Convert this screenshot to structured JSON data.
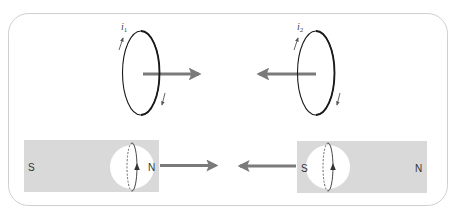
{
  "figure": {
    "colors": {
      "frame_border": "#cfcfcf",
      "magnet_fill": "#d9d9d9",
      "arrow": "#7a7a7a",
      "loop_stroke": "#1a1a1a",
      "circle_fill": "#ffffff"
    },
    "top_row": {
      "loop_left": {
        "current_label": "i",
        "current_subscript": "1",
        "force_direction": "right"
      },
      "loop_right": {
        "current_label": "i",
        "current_subscript": "2",
        "force_direction": "left"
      }
    },
    "bottom_row": {
      "magnet_left": {
        "left_pole": "S",
        "right_pole": "N",
        "force_direction": "right"
      },
      "magnet_right": {
        "left_pole": "S",
        "right_pole": "N",
        "force_direction": "left"
      }
    }
  }
}
